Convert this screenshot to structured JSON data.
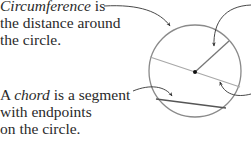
{
  "labels": {
    "circumference": {
      "term": "Circumference",
      "line1_rest": " is",
      "line2": "the distance around",
      "line3": "the circle."
    },
    "chord": {
      "prefix": "A ",
      "term": "chord",
      "line1_rest": " is a segment",
      "line2": "with endpoints",
      "line3": "on the circle."
    }
  },
  "figure": {
    "circle": {
      "cx": 195,
      "cy": 71,
      "r": 46,
      "stroke": "#8a8a8a"
    },
    "center_point": {
      "cx": 195,
      "cy": 72,
      "fill": "#111111"
    },
    "diameter": {
      "x1": 150,
      "y1": 57,
      "x2": 240,
      "y2": 87,
      "stroke": "#a8a8a8"
    },
    "radius": {
      "x1": 195,
      "y1": 72,
      "x2": 229,
      "y2": 41,
      "stroke": "#777777"
    },
    "chord": {
      "x1": 156,
      "y1": 99,
      "x2": 226,
      "y2": 108,
      "stroke": "#555555"
    },
    "arrow_color": "#333333"
  }
}
